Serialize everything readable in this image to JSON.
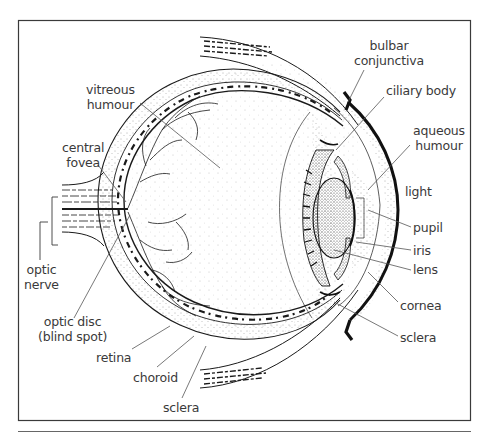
{
  "figure": {
    "frame_color": "#3a3a3a",
    "ink_color": "#1a1a1a",
    "label_color": "#3a3a3a"
  },
  "labels": {
    "bulbar_conjunctiva": [
      "bulbar",
      "conjunctiva"
    ],
    "ciliary_body": "ciliary body",
    "aqueous_humour": [
      "aqueous",
      "humour"
    ],
    "light": "light",
    "pupil": "pupil",
    "iris": "iris",
    "lens": "lens",
    "cornea": "cornea",
    "sclera_front": "sclera",
    "vitreous_humour": [
      "vitreous",
      "humour"
    ],
    "central_fovea": [
      "central",
      "fovea"
    ],
    "optic_nerve": [
      "optic",
      "nerve"
    ],
    "optic_disc": [
      "optic disc",
      "(blind spot)"
    ],
    "retina": "retina",
    "choroid": "choroid",
    "sclera_back": "sclera"
  }
}
